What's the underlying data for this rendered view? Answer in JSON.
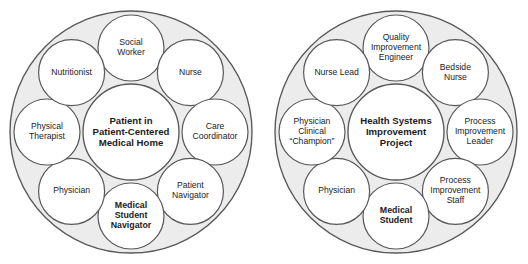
{
  "figure": {
    "background_color": "#ffffff",
    "ring_fill_color": "#ececec",
    "circle_fill_color": "#ffffff",
    "stroke_color": "#58585a",
    "text_color": "#1b1b1b"
  },
  "diagrams": [
    {
      "id": "patient-centered-medical-home",
      "center": {
        "lines": [
          "Patient in",
          "Patient-Centered",
          "Medical Home"
        ],
        "bold": true
      },
      "nodes": [
        {
          "lines": [
            "Social",
            "Worker"
          ],
          "bold": false
        },
        {
          "lines": [
            "Nurse"
          ],
          "bold": false
        },
        {
          "lines": [
            "Care",
            "Coordinator"
          ],
          "bold": false
        },
        {
          "lines": [
            "Patient",
            "Navigator"
          ],
          "bold": false
        },
        {
          "lines": [
            "Medical",
            "Student",
            "Navigator"
          ],
          "bold": true
        },
        {
          "lines": [
            "Physician"
          ],
          "bold": false
        },
        {
          "lines": [
            "Physical",
            "Therapist"
          ],
          "bold": false
        },
        {
          "lines": [
            "Nutritionist"
          ],
          "bold": false
        }
      ]
    },
    {
      "id": "health-systems-improvement-project",
      "center": {
        "lines": [
          "Health Systems",
          "Improvement",
          "Project"
        ],
        "bold": true
      },
      "nodes": [
        {
          "lines": [
            "Quality",
            "Improvement",
            "Engineer"
          ],
          "bold": false
        },
        {
          "lines": [
            "Bedside",
            "Nurse"
          ],
          "bold": false
        },
        {
          "lines": [
            "Process",
            "Improvement",
            "Leader"
          ],
          "bold": false
        },
        {
          "lines": [
            "Process",
            "Improvement",
            "Staff"
          ],
          "bold": false
        },
        {
          "lines": [
            "Medical",
            "Student"
          ],
          "bold": true
        },
        {
          "lines": [
            "Physician"
          ],
          "bold": false
        },
        {
          "lines": [
            "Physician",
            "Clinical",
            "“Champion”"
          ],
          "bold": false
        },
        {
          "lines": [
            "Nurse Lead"
          ],
          "bold": false
        }
      ]
    }
  ],
  "geometry": {
    "diagram_centers_x": [
      131,
      396
    ],
    "diagram_center_y": 132,
    "outer_radius": 121,
    "node_orbit_radius": 84,
    "node_radius": 33,
    "center_radius": 48,
    "node_angles_deg": [
      -90,
      -45,
      0,
      45,
      90,
      135,
      180,
      -135
    ]
  }
}
